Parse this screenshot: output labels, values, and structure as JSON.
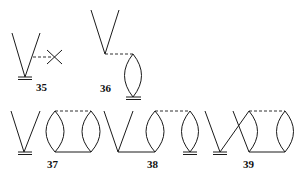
{
  "diagrams": [
    {
      "id": "35",
      "label": "35",
      "description": "V vertex with ground bar, dashed line to crossed X"
    },
    {
      "id": "36",
      "label": "36",
      "description": "V vertex dashed to lens loop with ground bar"
    },
    {
      "id": "37",
      "label": "37",
      "description": "V vertex with ground bar beside two lenses joined by dashed top and solid bottom"
    },
    {
      "id": "38",
      "label": "38",
      "description": "V vertex joined by solid line to two lenses, grounded second lens"
    },
    {
      "id": "39",
      "label": "39",
      "description": "Crossed V with ground bar connected to two lenses"
    }
  ],
  "colors": {
    "line": "#1a1a1a",
    "background": "#ffffff"
  }
}
